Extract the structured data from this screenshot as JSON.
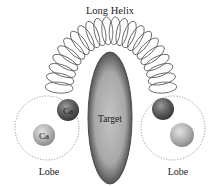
{
  "title": "Long Helix",
  "target": {
    "label": "Target",
    "cx": 110,
    "cy": 118,
    "rx": 22,
    "ry": 66
  },
  "helix": {
    "loops": 22,
    "arc_cx": 111,
    "arc_cy": 92,
    "arc_r": 52,
    "loop_rx": 5.5,
    "loop_ry": 14
  },
  "lobes": [
    {
      "label": "Lobe",
      "cx": 47,
      "cy": 128,
      "r": 32,
      "balls": [
        {
          "label": "Ca",
          "cx": 68,
          "cy": 110,
          "r": 11,
          "tone": "dark"
        },
        {
          "label": "Ca",
          "cx": 44,
          "cy": 135,
          "r": 11,
          "tone": "light"
        }
      ]
    },
    {
      "label": "Lobe",
      "cx": 173,
      "cy": 128,
      "r": 32,
      "balls": [
        {
          "label": "",
          "cx": 163,
          "cy": 109,
          "r": 11,
          "tone": "dark"
        },
        {
          "label": "",
          "cx": 182,
          "cy": 135,
          "r": 12,
          "tone": "light"
        }
      ]
    }
  ],
  "colors": {
    "target_fill": "#a6a6a6",
    "target_edge": "#4a4a4a",
    "helix_stroke": "#555555",
    "lobe_dash": "#8a8a8a",
    "ball_dark": "#5e5e5e",
    "ball_light": "#b4b4b4",
    "text": "#1a1a1a"
  }
}
